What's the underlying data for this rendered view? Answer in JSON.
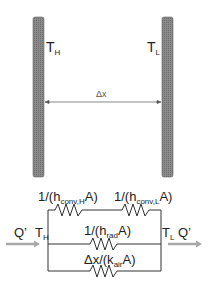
{
  "diagram": {
    "plates": {
      "hot_label": "T",
      "hot_sub": "H",
      "cold_label": "T",
      "cold_sub": "L",
      "gap_label": "Δx",
      "fill_color": "#8a8a8a"
    },
    "circuit": {
      "left_node": {
        "label": "T",
        "sub": "H"
      },
      "right_node": {
        "label": "T",
        "sub": "L"
      },
      "heat_in": "Q’",
      "heat_out": "Q’",
      "arrow_color": "#a0a0a0",
      "branches": [
        {
          "name": "convection",
          "resistors": [
            {
              "pre": "1/(h",
              "sub": "conv,H",
              "post": "A)"
            },
            {
              "pre": "1/(h",
              "sub": "conv,L",
              "post": "A)"
            }
          ]
        },
        {
          "name": "radiation",
          "resistors": [
            {
              "pre": "1/(h",
              "sub": "rad",
              "post": "A)"
            }
          ]
        },
        {
          "name": "conduction",
          "resistors": [
            {
              "pre": "Δx/(k",
              "sub": "air",
              "post": "A)"
            }
          ]
        }
      ]
    }
  }
}
